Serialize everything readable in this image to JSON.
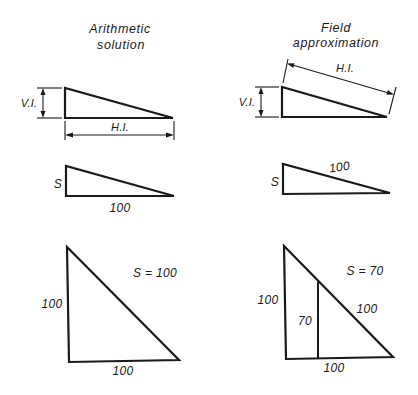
{
  "columns": {
    "left": {
      "title_line1": "Arithmetic",
      "title_line2": "solution"
    },
    "right": {
      "title_line1": "Field",
      "title_line2": "approximation"
    }
  },
  "row1": {
    "left": {
      "vertical_label": "V.I.",
      "horizontal_label": "H.I."
    },
    "right": {
      "vertical_label": "V.I.",
      "slope_label": "H.I."
    }
  },
  "row2": {
    "left": {
      "rise_label": "S",
      "run_label": "100"
    },
    "right": {
      "rise_label": "S",
      "slope_label": "100"
    }
  },
  "row3": {
    "left": {
      "equation": "S = 100",
      "vertical_label": "100",
      "base_label": "100"
    },
    "right": {
      "equation": "S = 70",
      "vertical_label": "100",
      "inner_vertical_label": "70",
      "hypotenuse_label": "100",
      "base_label": "100"
    }
  },
  "colors": {
    "ink": "#1a1a1a",
    "background": "#ffffff"
  }
}
